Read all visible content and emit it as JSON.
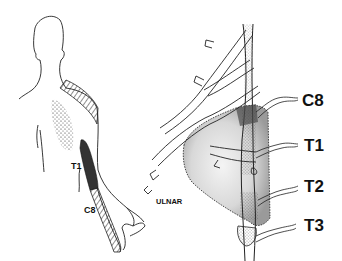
{
  "figure": {
    "left_panel": {
      "description": "posterior view of torso and arm with dermatome shading",
      "labels": {
        "t1": "T1",
        "c8": "C8"
      }
    },
    "right_panel": {
      "description": "sympathetic chain with stellate ganglion region shaded",
      "labels": {
        "ulnar": "ULNAR",
        "c8": "C8",
        "t1": "T1",
        "t2": "T2",
        "t3": "T3"
      }
    }
  }
}
